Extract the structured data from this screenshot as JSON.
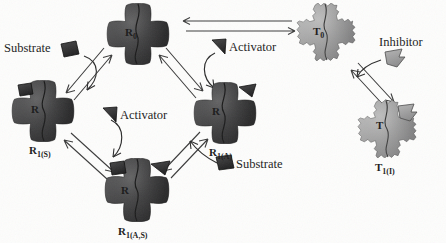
{
  "figure": {
    "background_color": "#fdfdfc",
    "relaxed_fill": "#3f3f40",
    "tense_fill": "#9b9b9b",
    "outline_color": "#1b1b1b",
    "arrow_color": "#3a3a3a"
  },
  "states": [
    {
      "id": "R0",
      "label": "R",
      "subscript": "0",
      "inner_letter": "R",
      "conformation": "relaxed",
      "fill": "#3f3f40",
      "edge_style": "smooth-lobed-cross",
      "ligands": []
    },
    {
      "id": "R1S",
      "label": "R",
      "subscript": "1(S)",
      "inner_letter": "R",
      "conformation": "relaxed",
      "fill": "#3f3f40",
      "edge_style": "smooth-lobed-cross",
      "ligands": [
        "substrate"
      ]
    },
    {
      "id": "R1A",
      "label": "R",
      "subscript": "1(A)",
      "inner_letter": "R",
      "conformation": "relaxed",
      "fill": "#3f3f40",
      "edge_style": "smooth-lobed-cross",
      "ligands": [
        "activator"
      ]
    },
    {
      "id": "R1AS",
      "label": "R",
      "subscript": "1(A,S)",
      "inner_letter": "R",
      "conformation": "relaxed",
      "fill": "#3f3f40",
      "edge_style": "smooth-lobed-cross",
      "ligands": [
        "substrate",
        "activator"
      ]
    },
    {
      "id": "T0",
      "label": "T",
      "subscript": "0",
      "inner_letter": "T",
      "conformation": "tense",
      "fill": "#9b9b9b",
      "edge_style": "jagged-lobed-cross",
      "ligands": []
    },
    {
      "id": "T1I",
      "label": "T",
      "subscript": "1(I)",
      "inner_letter": "T",
      "conformation": "tense",
      "fill": "#9b9b9b",
      "edge_style": "jagged-lobed-cross",
      "ligands": [
        "inhibitor"
      ]
    }
  ],
  "ligand_labels": [
    {
      "id": "substrate-top-left",
      "text": "Substrate",
      "glyph": "square",
      "glyph_fill": "#2e2e2e"
    },
    {
      "id": "activator-right",
      "text": "Activator",
      "glyph": "triangle",
      "glyph_fill": "#2e2e2e"
    },
    {
      "id": "activator-center",
      "text": "Activator",
      "glyph": "triangle",
      "glyph_fill": "#2e2e2e"
    },
    {
      "id": "substrate-bottom-right",
      "text": "Substrate",
      "glyph": "square",
      "glyph_fill": "#2e2e2e"
    },
    {
      "id": "inhibitor-right",
      "text": "Inhibitor",
      "glyph": "arrow-flag",
      "glyph_fill": "#9b9b9b"
    }
  ],
  "reactions": [
    {
      "id": "r0-r1s",
      "from": "R0",
      "to": "R1S",
      "type": "reversible-double-arrow"
    },
    {
      "id": "r0-r1a",
      "from": "R0",
      "to": "R1A",
      "type": "reversible-double-arrow"
    },
    {
      "id": "r0-t0",
      "from": "R0",
      "to": "T0",
      "type": "reversible-double-arrow"
    },
    {
      "id": "r1s-r1as",
      "from": "R1S",
      "to": "R1AS",
      "type": "reversible-double-arrow"
    },
    {
      "id": "r1a-r1as",
      "from": "R1A",
      "to": "R1AS",
      "type": "reversible-double-arrow"
    },
    {
      "id": "t0-t1i",
      "from": "T0",
      "to": "T1I",
      "type": "reversible-double-arrow"
    }
  ],
  "binding_arrows": [
    {
      "id": "substrate-to-r1s",
      "ligand": "substrate",
      "target": "R1S",
      "type": "curved"
    },
    {
      "id": "activator-to-r1a",
      "ligand": "activator",
      "target": "R1A",
      "type": "curved"
    },
    {
      "id": "activator-to-r1as",
      "ligand": "activator",
      "target": "R1AS",
      "type": "curved"
    },
    {
      "id": "substrate-to-r1as",
      "ligand": "substrate",
      "target": "R1AS",
      "type": "curved"
    },
    {
      "id": "inhibitor-to-t1i",
      "ligand": "inhibitor",
      "target": "T1I",
      "type": "curved"
    }
  ]
}
